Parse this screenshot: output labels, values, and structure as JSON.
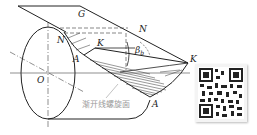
{
  "diagram": {
    "labels": {
      "plane": "G",
      "n_top": "N",
      "n_left": "N",
      "k_mid": "K",
      "k_right": "K",
      "a_left": "A",
      "a_bottom": "A",
      "origin": "O",
      "angle": "β",
      "angle_sub": "b",
      "surface_name": "渐开线螺旋面"
    },
    "colors": {
      "line": "#222222",
      "dash": "#555555",
      "hatch": "#333333",
      "caption": "#9a9a9a"
    }
  },
  "qr_code": {
    "present": true
  }
}
